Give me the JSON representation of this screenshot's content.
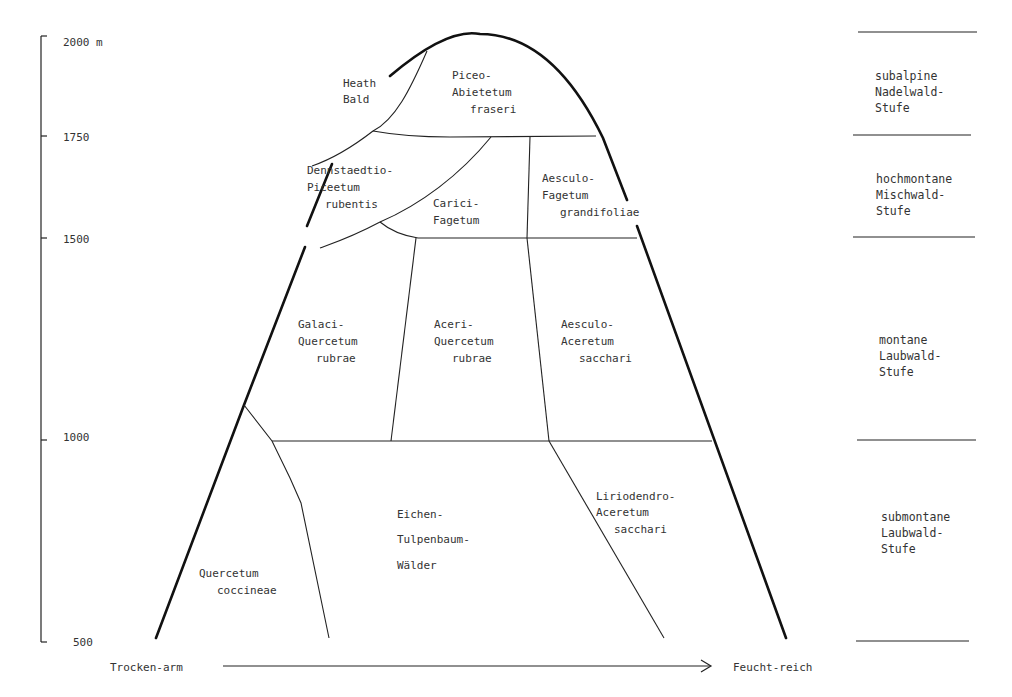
{
  "axis": {
    "unit": "m",
    "ticks": [
      {
        "label": "2000 m",
        "value": 2000
      },
      {
        "label": "1750",
        "value": 1750
      },
      {
        "label": "1500",
        "value": 1500
      },
      {
        "label": "1000",
        "value": 1000
      },
      {
        "label": "500",
        "value": 500
      }
    ]
  },
  "gradient": {
    "left_label": "Trocken-arm",
    "right_label": "Feucht-reich"
  },
  "communities": [
    {
      "id": "heath-bald",
      "lines": [
        "Heath",
        "Bald"
      ]
    },
    {
      "id": "piceo-abietetum",
      "lines": [
        "Piceo-",
        "Abietetum",
        "fraseri"
      ]
    },
    {
      "id": "dennstaedtio-piceetum",
      "lines": [
        "Dennstaedtio-",
        "Piceetum",
        "rubentis"
      ]
    },
    {
      "id": "carici-fagetum",
      "lines": [
        "Carici-",
        "Fagetum"
      ]
    },
    {
      "id": "aesculo-fagetum",
      "lines": [
        "Aesculo-",
        "Fagetum",
        "grandifoliae"
      ]
    },
    {
      "id": "galaci-quercetum",
      "lines": [
        "Galaci-",
        "Quercetum",
        "rubrae"
      ]
    },
    {
      "id": "aceri-quercetum",
      "lines": [
        "Aceri-",
        "Quercetum",
        "rubrae"
      ]
    },
    {
      "id": "aesculo-aceretum",
      "lines": [
        "Aesculo-",
        "Aceretum",
        "sacchari"
      ]
    },
    {
      "id": "quercetum-coccineae",
      "lines": [
        "Quercetum",
        "coccineae"
      ]
    },
    {
      "id": "eichen-tulpenbaum",
      "lines": [
        "Eichen-",
        "Tulpenbaum-",
        "Wälder"
      ]
    },
    {
      "id": "liriodendro-aceretum",
      "lines": [
        "Liriodendro-",
        "Aceretum",
        "sacchari"
      ]
    }
  ],
  "belts": [
    {
      "id": "subalpine",
      "lines": [
        "subalpine",
        "Nadelwald-",
        "Stufe"
      ]
    },
    {
      "id": "hochmontane",
      "lines": [
        "hochmontane",
        "Mischwald-",
        "Stufe"
      ]
    },
    {
      "id": "montane",
      "lines": [
        "montane",
        "Laubwald-",
        "Stufe"
      ]
    },
    {
      "id": "submontane",
      "lines": [
        "submontane",
        "Laubwald-",
        "Stufe"
      ]
    }
  ]
}
